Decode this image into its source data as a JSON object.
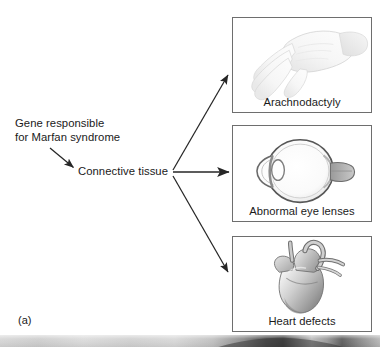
{
  "figure": {
    "part_label": "(a)",
    "flow": {
      "source_line1": "Gene responsible",
      "source_line2": "for Marfan syndrome",
      "intermediate": "Connective tissue"
    },
    "panels": [
      {
        "id": "arachnodactyly",
        "caption": "Arachnodactyly",
        "art": "hand-illustration"
      },
      {
        "id": "eye",
        "caption": "Abnormal eye lenses",
        "art": "eye-cross-section-illustration"
      },
      {
        "id": "heart",
        "caption": "Heart defects",
        "art": "heart-illustration"
      }
    ],
    "arrows": [
      {
        "name": "gene-to-connective-tissue",
        "direction": "down-right"
      },
      {
        "name": "connective-tissue-to-arachnodactyly",
        "direction": "up-right"
      },
      {
        "name": "connective-tissue-to-eye",
        "direction": "right"
      },
      {
        "name": "connective-tissue-to-heart",
        "direction": "down-right"
      }
    ],
    "colors": {
      "text": "#1a1a1a",
      "arrow": "#262626",
      "panel_border": "#6e6e6e",
      "background": "#ffffff"
    }
  }
}
